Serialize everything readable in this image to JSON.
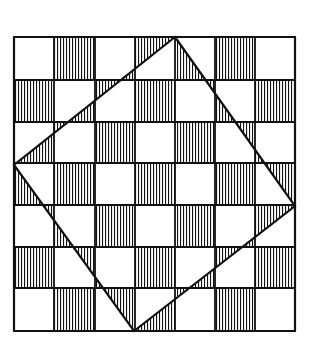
{
  "figure": {
    "grid": {
      "rows": 7,
      "cols": 7,
      "x_lines": [
        14,
        54,
        95,
        135,
        175,
        215,
        255,
        295
      ],
      "y_lines": [
        37,
        80,
        122,
        163,
        205,
        247,
        288,
        331
      ],
      "outside_hatched_rule": "(row+col) odd",
      "inside_hatched_rule": "(row+col) even"
    },
    "tilted_square": {
      "vertices": [
        [
          175,
          37
        ],
        [
          295,
          206
        ],
        [
          134,
          331
        ],
        [
          14,
          165
        ]
      ]
    },
    "hatch": {
      "spacing_px": 3,
      "line_width_px": 1,
      "direction": "vertical"
    },
    "colors": {
      "ink": "#111111",
      "paper": "#ffffff"
    }
  },
  "caption": {
    "text": ""
  }
}
